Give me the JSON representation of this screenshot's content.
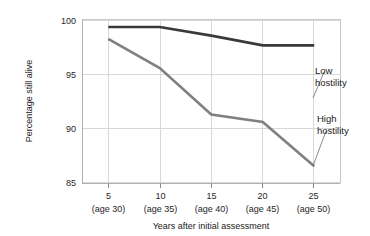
{
  "chart_data": {
    "type": "line",
    "title": "",
    "xlabel": "Years after initial assessment",
    "ylabel": "Percentage still alive",
    "x": [
      5,
      10,
      15,
      20,
      25
    ],
    "categories": [
      "5",
      "10",
      "15",
      "20",
      "25"
    ],
    "category_sublabels": [
      "(age 30)",
      "(age 35)",
      "(age 40)",
      "(age 45)",
      "(age 50)"
    ],
    "xlim": [
      2.5,
      27.5
    ],
    "ylim": [
      85,
      100
    ],
    "yticks": [
      85,
      90,
      95,
      100
    ],
    "ytick_labels": [
      "85",
      "90",
      "95",
      "100"
    ],
    "grid": true,
    "legend_position": "inline-annotations",
    "series": [
      {
        "name": "Low hostility",
        "color": "#3a3a3a",
        "line_width": 2.6,
        "values": [
          99.4,
          99.4,
          98.6,
          97.7,
          97.7
        ]
      },
      {
        "name": "High hostility",
        "color": "#808080",
        "line_width": 2.6,
        "values": [
          98.3,
          95.6,
          91.3,
          90.6,
          86.5
        ]
      }
    ],
    "annotations": [
      {
        "text_line1": "Low",
        "text_line2": "hostility",
        "target_x": 25,
        "target_y": 97.7
      },
      {
        "text_line1": "High",
        "text_line2": "hostility",
        "target_x": 25,
        "target_y": 86.5
      }
    ]
  },
  "axis": {
    "y_label": "Percentage still alive",
    "x_label": "Years after initial assessment",
    "y_tick_100": "100",
    "y_tick_95": "95",
    "y_tick_90": "90",
    "y_tick_85": "85",
    "x_tick_1": "5",
    "x_tick_2": "10",
    "x_tick_3": "15",
    "x_tick_4": "20",
    "x_tick_5": "25",
    "x_sub_1": "(age 30)",
    "x_sub_2": "(age 35)",
    "x_sub_3": "(age 40)",
    "x_sub_4": "(age 45)",
    "x_sub_5": "(age 50)"
  },
  "annotations": {
    "low_line1": "Low",
    "low_line2": "hostility",
    "high_line1": "High",
    "high_line2": "hostility"
  },
  "colors": {
    "low_hostility": "#3a3a3a",
    "high_hostility": "#808080",
    "grid": "#d4d4d4",
    "background": "#ffffff"
  }
}
